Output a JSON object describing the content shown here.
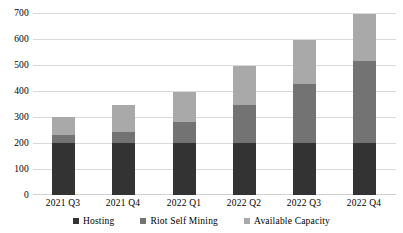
{
  "chart_data": {
    "type": "bar",
    "subtype": "stacked-bar",
    "title": "",
    "xlabel": "",
    "ylabel": "",
    "categories": [
      "2021 Q3",
      "2021 Q4",
      "2022 Q1",
      "2022 Q2",
      "2022 Q3",
      "2022 Q4"
    ],
    "series": [
      {
        "name": "Hosting",
        "color": "#333333",
        "values": [
          200,
          200,
          200,
          200,
          200,
          200
        ]
      },
      {
        "name": "Riot Self Mining",
        "color": "#737373",
        "values": [
          32,
          44,
          83,
          150,
          230,
          320
        ]
      },
      {
        "name": "Available Capacity",
        "color": "#a9a9a9",
        "values": [
          68,
          106,
          117,
          150,
          170,
          180
        ]
      }
    ],
    "totals": [
      300,
      350,
      400,
      500,
      600,
      700
    ],
    "ylim": [
      0,
      700
    ],
    "yticks": [
      0,
      100,
      200,
      300,
      400,
      500,
      600,
      700
    ],
    "ytick_labels": [
      "0",
      "100",
      "200",
      "300",
      "400",
      "500",
      "600",
      "700"
    ],
    "grid": true,
    "legend_position": "bottom"
  },
  "axes": {
    "y_labels": [
      "700",
      "600",
      "500",
      "400",
      "300",
      "200",
      "100",
      "0"
    ],
    "x_labels": [
      "2021 Q3",
      "2021 Q4",
      "2022 Q1",
      "2022 Q2",
      "2022 Q3",
      "2022 Q4"
    ]
  },
  "legend": {
    "items": [
      {
        "label": "Hosting",
        "color": "#333333"
      },
      {
        "label": "Riot Self Mining",
        "color": "#737373"
      },
      {
        "label": "Available Capacity",
        "color": "#a9a9a9"
      }
    ]
  }
}
